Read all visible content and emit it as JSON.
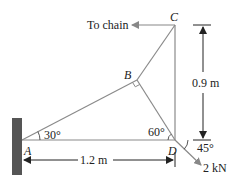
{
  "diagram": {
    "points": {
      "A": "A",
      "B": "B",
      "C": "C",
      "D": "D"
    },
    "labels": {
      "to_chain": "To chain",
      "angle_A": "30°",
      "angle_D": "60°",
      "angle_load": "45°",
      "height": "0.9 m",
      "width": "1.2 m",
      "load": "2 kN"
    },
    "colors": {
      "member": "#8a8a8a",
      "wall": "#555555",
      "text": "#222222"
    }
  }
}
